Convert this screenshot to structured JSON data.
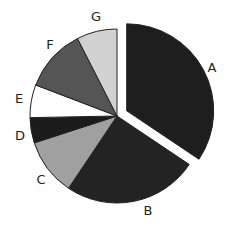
{
  "chart_data": {
    "type": "pie",
    "title": "",
    "categories": [
      "A",
      "B",
      "C",
      "D",
      "E",
      "F",
      "G"
    ],
    "values": [
      34.4,
      25.0,
      10.6,
      4.7,
      6.1,
      11.7,
      7.5
    ],
    "unit": "percent (estimated from slice angles)",
    "start_angle_deg": 0,
    "direction": "clockwise",
    "exploded": [
      "A"
    ],
    "colors": [
      "#1e1e1e",
      "#232323",
      "#a0a0a0",
      "#1c1c1c",
      "#ffffff",
      "#555555",
      "#d2d2d2"
    ],
    "legend": "none (labels placed outside slices)"
  },
  "labels": [
    {
      "text": "A",
      "x": 212,
      "y": 67
    },
    {
      "text": "B",
      "x": 148,
      "y": 210
    },
    {
      "text": "C",
      "x": 41,
      "y": 179
    },
    {
      "text": "D",
      "x": 20,
      "y": 135
    },
    {
      "text": "E",
      "x": 19,
      "y": 98
    },
    {
      "text": "F",
      "x": 50,
      "y": 44
    },
    {
      "text": "G",
      "x": 96,
      "y": 16
    }
  ]
}
